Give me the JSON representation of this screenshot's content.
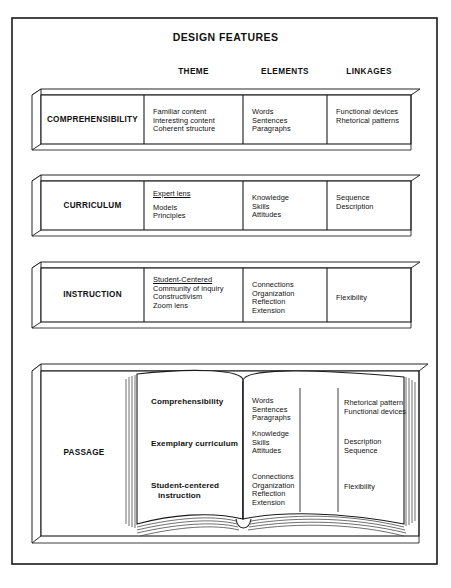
{
  "figure": {
    "title": "DESIGN FEATURES",
    "caption": ""
  },
  "column_headers": [
    {
      "label": "THEME"
    },
    {
      "label": "ELEMENTS"
    },
    {
      "label": "LINKAGES"
    }
  ],
  "rows": [
    {
      "label": "COMPREHENSIBILITY",
      "theme": [
        "Familiar content",
        "Interesting content",
        "Coherent structure"
      ],
      "theme_underlined": [],
      "elements": [
        "Words",
        "Sentences",
        "Paragraphs"
      ],
      "linkages": [
        "Functional devices",
        "Rhetorical patterns"
      ]
    },
    {
      "label": "CURRICULUM",
      "theme": [
        "Expert lens",
        "",
        "Models",
        "Principles"
      ],
      "theme_underlined": [
        "Expert lens"
      ],
      "elements": [
        "Knowledge",
        "Skills",
        "Attitudes"
      ],
      "linkages": [
        "Sequence",
        "Description"
      ]
    },
    {
      "label": "INSTRUCTION",
      "theme": [
        "Student-Centered",
        "Community of inquiry",
        "Constructivism",
        "Zoom lens"
      ],
      "theme_underlined": [
        "Student-Centered"
      ],
      "elements": [
        "Connections",
        "Organization",
        "Reflection",
        "Extension"
      ],
      "linkages": [
        "Flexibility"
      ]
    }
  ],
  "passage": {
    "label": "PASSAGE",
    "entries": [
      {
        "heading_line1": "Comprehensibility",
        "heading_line2": "",
        "elements": [
          "Words",
          "Sentences",
          "Paragraphs"
        ],
        "linkages": [
          "Rhetorical pattern",
          "Functional devices"
        ]
      },
      {
        "heading_line1": "Exemplary curriculum",
        "heading_line2": "",
        "elements": [
          "Knowledge",
          "Skills",
          "Attitudes"
        ],
        "linkages": [
          "Description",
          "Sequence"
        ]
      },
      {
        "heading_line1": "Student-centered",
        "heading_line2": "instruction",
        "elements": [
          "Connections",
          "Organization",
          "Reflection",
          "Extension"
        ],
        "linkages": [
          "Flexibility"
        ]
      }
    ]
  },
  "colors": {
    "ink": "#111111",
    "paper": "#ffffff",
    "rule": "#1a1a1a",
    "page_edge": "#555555"
  }
}
